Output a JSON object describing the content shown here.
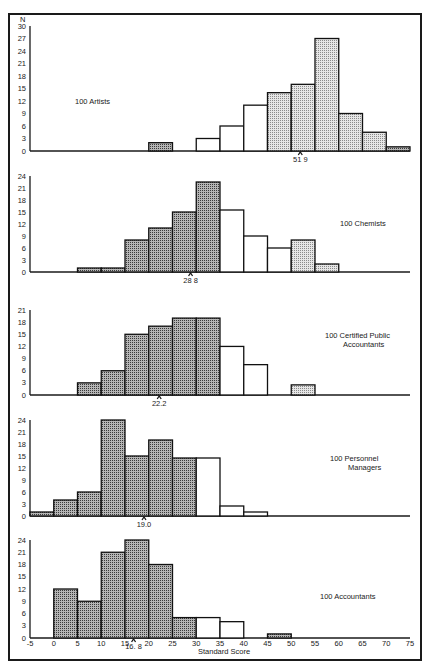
{
  "chart_data": [
    {
      "type": "bar",
      "title": "100 Artists",
      "xlabel": "Standard Score",
      "ylabel": "N",
      "bin_width": 5,
      "ylim": [
        0,
        30
      ],
      "yticks": [
        0,
        3,
        6,
        9,
        12,
        15,
        18,
        21,
        24,
        27,
        30
      ],
      "mean": 51.9,
      "mean_label": "51 9",
      "bins": [
        {
          "start": 20,
          "end": 25,
          "value": 2,
          "shade": "dark"
        },
        {
          "start": 30,
          "end": 35,
          "value": 3,
          "shade": "open"
        },
        {
          "start": 35,
          "end": 40,
          "value": 6,
          "shade": "open"
        },
        {
          "start": 40,
          "end": 45,
          "value": 11,
          "shade": "open"
        },
        {
          "start": 45,
          "end": 50,
          "value": 14,
          "shade": "light"
        },
        {
          "start": 50,
          "end": 55,
          "value": 16,
          "shade": "light"
        },
        {
          "start": 55,
          "end": 60,
          "value": 27,
          "shade": "light"
        },
        {
          "start": 60,
          "end": 65,
          "value": 9,
          "shade": "light"
        },
        {
          "start": 65,
          "end": 70,
          "value": 4.5,
          "shade": "light"
        },
        {
          "start": 70,
          "end": 75,
          "value": 1,
          "shade": "dark"
        }
      ]
    },
    {
      "type": "bar",
      "title": "100 Chemists",
      "ylim": [
        0,
        24
      ],
      "yticks": [
        0,
        3,
        6,
        9,
        12,
        15,
        18,
        21,
        24
      ],
      "mean": 28.8,
      "mean_label": "28 8",
      "bins": [
        {
          "start": 5,
          "end": 10,
          "value": 1,
          "shade": "dark"
        },
        {
          "start": 10,
          "end": 15,
          "value": 1,
          "shade": "dark"
        },
        {
          "start": 15,
          "end": 20,
          "value": 8,
          "shade": "dark"
        },
        {
          "start": 20,
          "end": 25,
          "value": 11,
          "shade": "dark"
        },
        {
          "start": 25,
          "end": 30,
          "value": 15,
          "shade": "dark"
        },
        {
          "start": 30,
          "end": 35,
          "value": 22.5,
          "shade": "dark"
        },
        {
          "start": 35,
          "end": 40,
          "value": 15.5,
          "shade": "open"
        },
        {
          "start": 40,
          "end": 45,
          "value": 9,
          "shade": "open"
        },
        {
          "start": 45,
          "end": 50,
          "value": 6,
          "shade": "open"
        },
        {
          "start": 50,
          "end": 55,
          "value": 8,
          "shade": "light"
        },
        {
          "start": 55,
          "end": 60,
          "value": 2,
          "shade": "light"
        }
      ]
    },
    {
      "type": "bar",
      "title": "100 Certified Public Accountants",
      "title_lines": [
        "100  Certified Public",
        "Accountants"
      ],
      "ylim": [
        0,
        21
      ],
      "yticks": [
        0,
        3,
        6,
        9,
        12,
        15,
        18,
        21
      ],
      "mean": 22.2,
      "mean_label": "22.2",
      "bins": [
        {
          "start": 5,
          "end": 10,
          "value": 3,
          "shade": "dark"
        },
        {
          "start": 10,
          "end": 15,
          "value": 6,
          "shade": "dark"
        },
        {
          "start": 15,
          "end": 20,
          "value": 15,
          "shade": "dark"
        },
        {
          "start": 20,
          "end": 25,
          "value": 17,
          "shade": "dark"
        },
        {
          "start": 25,
          "end": 30,
          "value": 19,
          "shade": "dark"
        },
        {
          "start": 30,
          "end": 35,
          "value": 19,
          "shade": "dark"
        },
        {
          "start": 35,
          "end": 40,
          "value": 12,
          "shade": "open"
        },
        {
          "start": 40,
          "end": 45,
          "value": 7.5,
          "shade": "open"
        },
        {
          "start": 50,
          "end": 55,
          "value": 2.5,
          "shade": "light"
        }
      ]
    },
    {
      "type": "bar",
      "title": "100 Personnel Managers",
      "title_lines": [
        "100  Personnel",
        "Managers"
      ],
      "ylim": [
        0,
        24
      ],
      "yticks": [
        0,
        3,
        6,
        9,
        12,
        15,
        18,
        21,
        24
      ],
      "mean": 19.0,
      "mean_label": "19.0",
      "bins": [
        {
          "start": -5,
          "end": 0,
          "value": 1,
          "shade": "dark"
        },
        {
          "start": 0,
          "end": 5,
          "value": 4,
          "shade": "dark"
        },
        {
          "start": 5,
          "end": 10,
          "value": 6,
          "shade": "dark"
        },
        {
          "start": 10,
          "end": 15,
          "value": 24,
          "shade": "dark"
        },
        {
          "start": 15,
          "end": 20,
          "value": 15,
          "shade": "dark"
        },
        {
          "start": 20,
          "end": 25,
          "value": 19,
          "shade": "dark"
        },
        {
          "start": 25,
          "end": 30,
          "value": 14.5,
          "shade": "dark"
        },
        {
          "start": 30,
          "end": 35,
          "value": 14.5,
          "shade": "open"
        },
        {
          "start": 35,
          "end": 40,
          "value": 2.5,
          "shade": "open"
        },
        {
          "start": 40,
          "end": 45,
          "value": 1,
          "shade": "open"
        }
      ]
    },
    {
      "type": "bar",
      "title": "100 Accountants",
      "ylim": [
        0,
        24
      ],
      "yticks": [
        0,
        3,
        6,
        9,
        12,
        15,
        18,
        21,
        24
      ],
      "mean": 16.8,
      "mean_label": "16. 8",
      "xticks": [
        -5,
        0,
        5,
        10,
        15,
        20,
        25,
        30,
        35,
        40,
        45,
        50,
        55,
        60,
        65,
        70,
        75
      ],
      "bins": [
        {
          "start": 0,
          "end": 5,
          "value": 12,
          "shade": "dark"
        },
        {
          "start": 5,
          "end": 10,
          "value": 9,
          "shade": "dark"
        },
        {
          "start": 10,
          "end": 15,
          "value": 21,
          "shade": "dark"
        },
        {
          "start": 15,
          "end": 20,
          "value": 24,
          "shade": "dark"
        },
        {
          "start": 20,
          "end": 25,
          "value": 18,
          "shade": "dark"
        },
        {
          "start": 25,
          "end": 30,
          "value": 5,
          "shade": "dark"
        },
        {
          "start": 30,
          "end": 35,
          "value": 5,
          "shade": "open"
        },
        {
          "start": 35,
          "end": 40,
          "value": 4,
          "shade": "open"
        },
        {
          "start": 45,
          "end": 50,
          "value": 1,
          "shade": "dark"
        }
      ]
    }
  ],
  "axis": {
    "ylabel": "N",
    "xlabel": "Standard Score",
    "xlim": [
      -5,
      75
    ],
    "xticks": [
      -5,
      0,
      5,
      10,
      15,
      20,
      25,
      30,
      35,
      40,
      45,
      50,
      55,
      60,
      65,
      70,
      75
    ]
  },
  "colors": {
    "ink": "#1a1a1a",
    "background": "#ffffff",
    "dark_fill": "#9a9a9a",
    "light_fill": "#d2d2d2"
  }
}
